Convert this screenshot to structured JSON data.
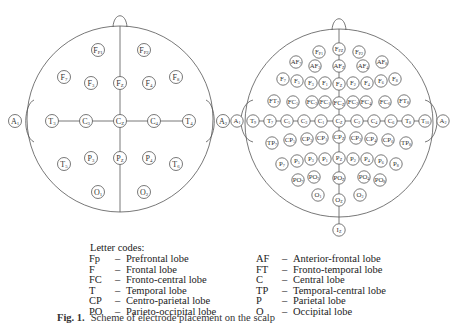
{
  "left_head": {
    "label": "10-20 system",
    "electrodes": [
      {
        "id": "Fp1",
        "main": "F",
        "sub": "P1",
        "x": 98,
        "y": 50
      },
      {
        "id": "Fp2",
        "main": "F",
        "sub": "P2",
        "x": 144,
        "y": 50
      },
      {
        "id": "F7",
        "main": "F",
        "sub": "7",
        "x": 64,
        "y": 77
      },
      {
        "id": "F3",
        "main": "F",
        "sub": "3",
        "x": 91,
        "y": 83
      },
      {
        "id": "Fz",
        "main": "F",
        "sub": "Z",
        "x": 120,
        "y": 83
      },
      {
        "id": "F4",
        "main": "F",
        "sub": "4",
        "x": 149,
        "y": 83
      },
      {
        "id": "F8",
        "main": "F",
        "sub": "8",
        "x": 176,
        "y": 77
      },
      {
        "id": "A1",
        "main": "A",
        "sub": "1",
        "x": 15,
        "y": 121
      },
      {
        "id": "T3",
        "main": "T",
        "sub": "3",
        "x": 52,
        "y": 121
      },
      {
        "id": "C3",
        "main": "C",
        "sub": "3",
        "x": 86,
        "y": 121
      },
      {
        "id": "Cz",
        "main": "C",
        "sub": "Z",
        "x": 120,
        "y": 121
      },
      {
        "id": "C4",
        "main": "C",
        "sub": "4",
        "x": 154,
        "y": 121
      },
      {
        "id": "T4",
        "main": "T",
        "sub": "4",
        "x": 189,
        "y": 121
      },
      {
        "id": "A2",
        "main": "A",
        "sub": "2",
        "x": 223,
        "y": 121
      },
      {
        "id": "T5",
        "main": "T",
        "sub": "5",
        "x": 64,
        "y": 164
      },
      {
        "id": "P3",
        "main": "P",
        "sub": "3",
        "x": 91,
        "y": 158
      },
      {
        "id": "Pz",
        "main": "P",
        "sub": "Z",
        "x": 120,
        "y": 158
      },
      {
        "id": "P4",
        "main": "P",
        "sub": "4",
        "x": 149,
        "y": 158
      },
      {
        "id": "T6",
        "main": "T",
        "sub": "6",
        "x": 176,
        "y": 164
      },
      {
        "id": "O1",
        "main": "O",
        "sub": "1",
        "x": 98,
        "y": 192
      },
      {
        "id": "O2",
        "main": "O",
        "sub": "2",
        "x": 144,
        "y": 192
      }
    ]
  },
  "right_head": {
    "label": "10-10 system",
    "electrodes": [
      {
        "id": "Fp1",
        "main": "F",
        "sub": "P1",
        "x": 319,
        "y": 52
      },
      {
        "id": "Fpz",
        "main": "F",
        "sub": "PZ",
        "x": 339,
        "y": 49
      },
      {
        "id": "Fp2",
        "main": "F",
        "sub": "P2",
        "x": 359,
        "y": 52
      },
      {
        "id": "AF7",
        "main": "AF",
        "sub": "7",
        "x": 296,
        "y": 62
      },
      {
        "id": "AF3",
        "main": "AF",
        "sub": "3",
        "x": 315,
        "y": 66
      },
      {
        "id": "AFz",
        "main": "AF",
        "sub": "Z",
        "x": 339,
        "y": 66
      },
      {
        "id": "AF4",
        "main": "AF",
        "sub": "4",
        "x": 363,
        "y": 66
      },
      {
        "id": "AF8",
        "main": "AF",
        "sub": "8",
        "x": 382,
        "y": 62
      },
      {
        "id": "F7",
        "main": "F",
        "sub": "7",
        "x": 283,
        "y": 79
      },
      {
        "id": "F5",
        "main": "F",
        "sub": "5",
        "x": 297,
        "y": 81
      },
      {
        "id": "F3",
        "main": "F",
        "sub": "3",
        "x": 311,
        "y": 83
      },
      {
        "id": "F1",
        "main": "F",
        "sub": "1",
        "x": 325,
        "y": 83
      },
      {
        "id": "Fz",
        "main": "F",
        "sub": "Z",
        "x": 339,
        "y": 84
      },
      {
        "id": "F2",
        "main": "F",
        "sub": "2",
        "x": 353,
        "y": 83
      },
      {
        "id": "F4",
        "main": "F",
        "sub": "4",
        "x": 367,
        "y": 83
      },
      {
        "id": "F6",
        "main": "F",
        "sub": "6",
        "x": 381,
        "y": 81
      },
      {
        "id": "F8",
        "main": "F",
        "sub": "8",
        "x": 395,
        "y": 79
      },
      {
        "id": "FT7",
        "main": "FT",
        "sub": "7",
        "x": 274,
        "y": 101
      },
      {
        "id": "FC5",
        "main": "FC",
        "sub": "5",
        "x": 293,
        "y": 102
      },
      {
        "id": "FC3",
        "main": "FC",
        "sub": "3",
        "x": 312,
        "y": 102
      },
      {
        "id": "FC1",
        "main": "FC",
        "sub": "1",
        "x": 325,
        "y": 102
      },
      {
        "id": "FCz",
        "main": "FC",
        "sub": "Z",
        "x": 339,
        "y": 103
      },
      {
        "id": "FC2",
        "main": "FC",
        "sub": "2",
        "x": 353,
        "y": 102
      },
      {
        "id": "FC4",
        "main": "FC",
        "sub": "4",
        "x": 366,
        "y": 102
      },
      {
        "id": "FC6",
        "main": "FC",
        "sub": "6",
        "x": 385,
        "y": 102
      },
      {
        "id": "FT8",
        "main": "FT",
        "sub": "8",
        "x": 404,
        "y": 101
      },
      {
        "id": "A1",
        "main": "A",
        "sub": "1",
        "x": 237,
        "y": 121
      },
      {
        "id": "T9",
        "main": "T",
        "sub": "9",
        "x": 253,
        "y": 121
      },
      {
        "id": "T7",
        "main": "T",
        "sub": "7",
        "x": 270,
        "y": 121
      },
      {
        "id": "C5",
        "main": "C",
        "sub": "5",
        "x": 287,
        "y": 121
      },
      {
        "id": "C3",
        "main": "C",
        "sub": "3",
        "x": 304,
        "y": 121
      },
      {
        "id": "C1",
        "main": "C",
        "sub": "1",
        "x": 321,
        "y": 121
      },
      {
        "id": "Cz",
        "main": "C",
        "sub": "Z",
        "x": 339,
        "y": 121
      },
      {
        "id": "C2",
        "main": "C",
        "sub": "2",
        "x": 357,
        "y": 121
      },
      {
        "id": "C4",
        "main": "C",
        "sub": "4",
        "x": 374,
        "y": 121
      },
      {
        "id": "C6",
        "main": "C",
        "sub": "6",
        "x": 391,
        "y": 121
      },
      {
        "id": "T8",
        "main": "T",
        "sub": "8",
        "x": 408,
        "y": 121
      },
      {
        "id": "T10",
        "main": "T",
        "sub": "10",
        "x": 425,
        "y": 121
      },
      {
        "id": "A2",
        "main": "A",
        "sub": "2",
        "x": 443,
        "y": 121
      },
      {
        "id": "TP7",
        "main": "TP",
        "sub": "7",
        "x": 272,
        "y": 143
      },
      {
        "id": "CP5",
        "main": "CP",
        "sub": "5",
        "x": 290,
        "y": 140
      },
      {
        "id": "CP3",
        "main": "CP",
        "sub": "3",
        "x": 307,
        "y": 139
      },
      {
        "id": "CP1",
        "main": "CP",
        "sub": "1",
        "x": 322,
        "y": 138
      },
      {
        "id": "CPz",
        "main": "CP",
        "sub": "Z",
        "x": 339,
        "y": 137
      },
      {
        "id": "CP2",
        "main": "CP",
        "sub": "2",
        "x": 356,
        "y": 138
      },
      {
        "id": "CP4",
        "main": "CP",
        "sub": "4",
        "x": 371,
        "y": 139
      },
      {
        "id": "CP6",
        "main": "CP",
        "sub": "6",
        "x": 388,
        "y": 140
      },
      {
        "id": "TP8",
        "main": "TP",
        "sub": "8",
        "x": 406,
        "y": 143
      },
      {
        "id": "P7",
        "main": "P",
        "sub": "7",
        "x": 282,
        "y": 164
      },
      {
        "id": "P5",
        "main": "P",
        "sub": "5",
        "x": 297,
        "y": 161
      },
      {
        "id": "P3",
        "main": "P",
        "sub": "3",
        "x": 311,
        "y": 159
      },
      {
        "id": "P1",
        "main": "P",
        "sub": "1",
        "x": 325,
        "y": 159
      },
      {
        "id": "Pz",
        "main": "P",
        "sub": "Z",
        "x": 339,
        "y": 158
      },
      {
        "id": "P2",
        "main": "P",
        "sub": "2",
        "x": 353,
        "y": 159
      },
      {
        "id": "P4",
        "main": "P",
        "sub": "4",
        "x": 367,
        "y": 159
      },
      {
        "id": "P6",
        "main": "P",
        "sub": "6",
        "x": 381,
        "y": 161
      },
      {
        "id": "P8",
        "main": "P",
        "sub": "8",
        "x": 396,
        "y": 164
      },
      {
        "id": "PO7",
        "main": "PO",
        "sub": "7",
        "x": 298,
        "y": 180
      },
      {
        "id": "PO3",
        "main": "PO",
        "sub": "3",
        "x": 314,
        "y": 177
      },
      {
        "id": "POz",
        "main": "PO",
        "sub": "Z",
        "x": 339,
        "y": 178
      },
      {
        "id": "PO4",
        "main": "PO",
        "sub": "4",
        "x": 364,
        "y": 177
      },
      {
        "id": "PO8",
        "main": "PO",
        "sub": "8",
        "x": 380,
        "y": 180
      },
      {
        "id": "O1",
        "main": "O",
        "sub": "1",
        "x": 318,
        "y": 195
      },
      {
        "id": "Oz",
        "main": "O",
        "sub": "Z",
        "x": 339,
        "y": 200
      },
      {
        "id": "O2",
        "main": "O",
        "sub": "2",
        "x": 360,
        "y": 195
      },
      {
        "id": "Iz",
        "main": "I",
        "sub": "Z",
        "x": 339,
        "y": 230
      }
    ]
  },
  "legend": {
    "title": "Letter codes:",
    "left": [
      {
        "code": "Fp",
        "dash": "–",
        "meaning": "Prefrontal lobe"
      },
      {
        "code": "F",
        "dash": "–",
        "meaning": "Frontal lobe"
      },
      {
        "code": "FC",
        "dash": "–",
        "meaning": "Fronto-central lobe"
      },
      {
        "code": "T",
        "dash": "–",
        "meaning": "Temporal lobe"
      },
      {
        "code": "CP",
        "dash": "–",
        "meaning": "Centro-parietal lobe"
      },
      {
        "code": "PO",
        "dash": "–",
        "meaning": "Parieto-occipital lobe"
      }
    ],
    "right": [
      {
        "code": "AF",
        "dash": "–",
        "meaning": "Anterior-frontal lobe"
      },
      {
        "code": "FT",
        "dash": "–",
        "meaning": "Fronto-temporal lobe"
      },
      {
        "code": "C",
        "dash": "–",
        "meaning": "Central lobe"
      },
      {
        "code": "TP",
        "dash": "–",
        "meaning": "Temporal-central lobe"
      },
      {
        "code": "P",
        "dash": "–",
        "meaning": "Parietal lobe"
      },
      {
        "code": "O",
        "dash": "–",
        "meaning": "Occipital lobe"
      }
    ]
  },
  "caption": {
    "fig": "Fig. 1.",
    "text": "Scheme of electrode placement on the scalp"
  },
  "colors": {
    "line": "#555555",
    "text": "#333333",
    "background": "#ffffff"
  }
}
